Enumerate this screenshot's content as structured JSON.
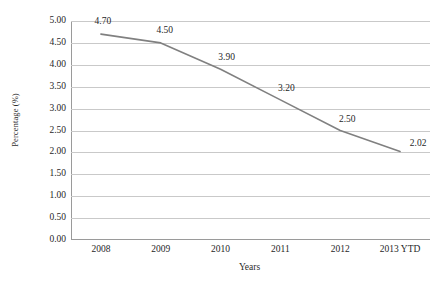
{
  "chart_data": {
    "type": "line",
    "title": "",
    "xlabel": "Years",
    "ylabel": "Percentage (%)",
    "categories": [
      "2008",
      "2009",
      "2010",
      "2011",
      "2012",
      "2013 YTD"
    ],
    "values": [
      4.7,
      4.5,
      3.9,
      3.2,
      2.5,
      2.02
    ],
    "point_labels": [
      "4.70",
      "4.50",
      "3.90",
      "3.20",
      "2.50",
      "2.02"
    ],
    "ylim": [
      0.0,
      5.0
    ],
    "ytick_labels": [
      "5.00",
      "4.50",
      "4.00",
      "3.50",
      "3.00",
      "2.50",
      "2.00",
      "1.50",
      "1.00",
      "0.50",
      "0.00"
    ],
    "ytick_values": [
      5.0,
      4.5,
      4.0,
      3.5,
      3.0,
      2.5,
      2.0,
      1.5,
      1.0,
      0.5,
      0.0
    ],
    "grid": true,
    "grid_axis": "y",
    "legend": false,
    "legend_position": "none",
    "series_color": "#808080",
    "gridline_color": "#c9c9c9",
    "axis_color": "#9a9a9a",
    "markers": false,
    "line_width": 1.6
  }
}
